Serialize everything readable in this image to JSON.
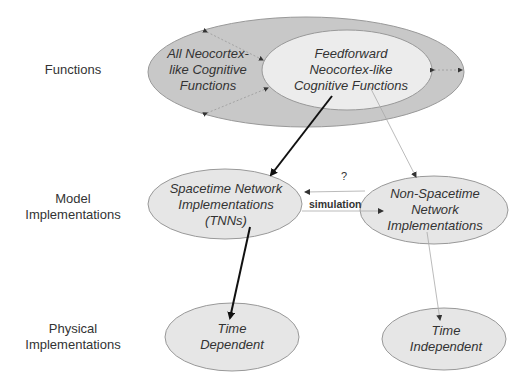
{
  "row_labels": {
    "functions": [
      "Functions"
    ],
    "model": [
      "Model",
      "Implementations"
    ],
    "physical": [
      "Physical",
      "Implementations"
    ]
  },
  "nodes": {
    "all_functions": {
      "lines": [
        "All Neocortex-",
        "like Cognitive",
        "Functions"
      ],
      "fill": "#c8c8c8"
    },
    "feedforward_functions": {
      "lines": [
        "Feedforward",
        "Neocortex-like",
        "Cognitive Functions"
      ],
      "fill": "#ececec"
    },
    "spacetime_impl": {
      "lines": [
        "Spacetime Network",
        "Implementations",
        "(TNNs)"
      ],
      "fill": "#e6e6e6"
    },
    "non_spacetime_impl": {
      "lines": [
        "Non-Spacetime",
        "Network",
        "Implementations"
      ],
      "fill": "#e6e6e6"
    },
    "time_dependent": {
      "lines": [
        "Time",
        "Dependent"
      ],
      "fill": "#e6e6e6"
    },
    "time_independent": {
      "lines": [
        "Time",
        "Independent"
      ],
      "fill": "#e6e6e6"
    }
  },
  "edges": {
    "question_label": "?",
    "simulation_label": "simulation"
  },
  "colors": {
    "text": "#333333",
    "stroke": "#888888",
    "bold_arrow": "#111111",
    "thin_arrow": "#999999"
  }
}
